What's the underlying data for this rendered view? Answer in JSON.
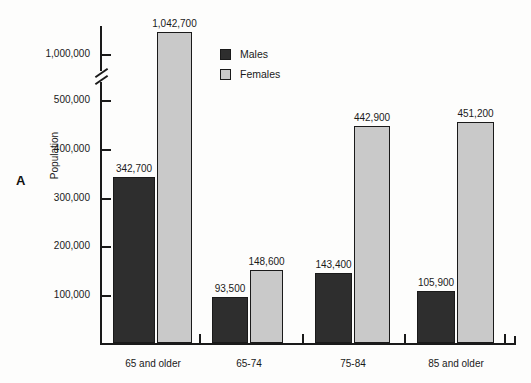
{
  "chart_data": {
    "type": "bar",
    "title": "",
    "panel_label": "A",
    "xlabel": "",
    "ylabel": "Population",
    "categories": [
      "65 and older",
      "65-74",
      "75-84",
      "85 and older"
    ],
    "series": [
      {
        "name": "Males",
        "color": "#2e2e2e",
        "values": [
          342700,
          93500,
          143400,
          105900
        ],
        "value_labels": [
          "342,700",
          "93,500",
          "143,400",
          "105,900"
        ]
      },
      {
        "name": "Females",
        "color": "#c9c9c9",
        "values": [
          1042700,
          148600,
          442900,
          451200
        ],
        "value_labels": [
          "1,042,700",
          "148,600",
          "442,900",
          "451,200"
        ]
      }
    ],
    "ytick_labels": [
      "1,000,000",
      "500,000",
      "400,000",
      "300,000",
      "200,000",
      "100,000"
    ],
    "ytick_values": [
      1000000,
      500000,
      400000,
      300000,
      200000,
      100000
    ],
    "ylim": [
      0,
      1100000
    ],
    "axis_break": true,
    "axis_break_between": [
      500000,
      1000000
    ],
    "grid": false,
    "legend_position": "top-center",
    "legend_entries": [
      "Males",
      "Females"
    ]
  },
  "bars": [
    {
      "name": "bar-65-and-older-males",
      "series": "Males",
      "category": "65 and older",
      "label": "342,700",
      "left": 113,
      "width": 42,
      "top": 177,
      "height": 166
    },
    {
      "name": "bar-65-and-older-females",
      "series": "Females",
      "category": "65 and older",
      "label": "1,042,700",
      "left": 157,
      "width": 35,
      "top": 32,
      "height": 311
    },
    {
      "name": "bar-65-74-males",
      "series": "Males",
      "category": "65-74",
      "label": "93,500",
      "left": 212,
      "width": 36,
      "top": 297,
      "height": 46
    },
    {
      "name": "bar-65-74-females",
      "series": "Females",
      "category": "65-74",
      "label": "148,600",
      "left": 250,
      "width": 33,
      "top": 270,
      "height": 73
    },
    {
      "name": "bar-75-84-males",
      "series": "Males",
      "category": "75-84",
      "label": "143,400",
      "left": 315,
      "width": 37,
      "top": 273,
      "height": 70
    },
    {
      "name": "bar-75-84-females",
      "series": "Females",
      "category": "75-84",
      "label": "442,900",
      "left": 354,
      "width": 36,
      "top": 126,
      "height": 217
    },
    {
      "name": "bar-85-and-older-males",
      "series": "Males",
      "category": "85 and older",
      "label": "105,900",
      "left": 417,
      "width": 38,
      "top": 291,
      "height": 52
    },
    {
      "name": "bar-85-and-older-females",
      "series": "Females",
      "category": "85 and older",
      "label": "451,200",
      "left": 457,
      "width": 37,
      "top": 122,
      "height": 221
    }
  ],
  "y_ticks": [
    {
      "label": "1,000,000",
      "top": 54
    },
    {
      "label": "500,000",
      "top": 100
    },
    {
      "label": "400,000",
      "top": 149
    },
    {
      "label": "300,000",
      "top": 198
    },
    {
      "label": "200,000",
      "top": 246
    },
    {
      "label": "100,000",
      "top": 295
    }
  ],
  "x_ticks": [
    {
      "left": 199
    },
    {
      "left": 302
    },
    {
      "left": 404
    },
    {
      "left": 504
    }
  ],
  "x_categories": [
    {
      "label": "65 and older",
      "center": 153
    },
    {
      "label": "65-74",
      "center": 249
    },
    {
      "label": "75-84",
      "center": 353
    },
    {
      "label": "85 and older",
      "center": 456
    }
  ],
  "legend": {
    "entries": [
      {
        "label": "Males",
        "swatch": "males"
      },
      {
        "label": "Females",
        "swatch": "females"
      }
    ]
  }
}
